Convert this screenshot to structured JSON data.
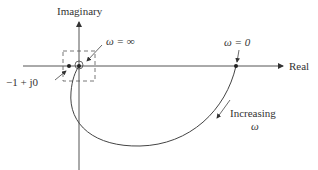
{
  "diagram": {
    "type": "nyquist-plot",
    "axes": {
      "vertical_label": "Imaginary",
      "horizontal_label": "Real"
    },
    "annotations": {
      "omega_inf": "ω = ∞",
      "omega_zero": "ω = 0",
      "critical_point": "−1 + j0",
      "increasing": "Increasing",
      "omega_symbol": "ω"
    },
    "colors": {
      "line": "#444444",
      "text": "#333333",
      "background": "#ffffff"
    }
  }
}
